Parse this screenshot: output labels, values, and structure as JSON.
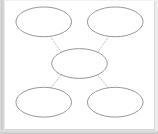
{
  "document": {
    "title": "Concept Map",
    "background_color": "#ffffff",
    "page_border_color": "#d6d6d6",
    "gutter_color": "#c9c9c9"
  },
  "diagram": {
    "type": "concept-map",
    "layout": "hub-and-spoke",
    "node_count": 5,
    "connector_count": 4,
    "node_shape": "ellipse",
    "node_fill": "#ffffff",
    "node_stroke": "#8a8a8a",
    "connector_stroke": "#b9b9b9",
    "connector_style": "dotted",
    "nodes": [
      {
        "id": "node-top-left",
        "label": "",
        "cx": 39,
        "cy": 21,
        "rx": 28,
        "ry": 15
      },
      {
        "id": "node-top-right",
        "label": "",
        "cx": 111,
        "cy": 21,
        "rx": 28,
        "ry": 15
      },
      {
        "id": "node-center",
        "label": "",
        "cx": 75,
        "cy": 63,
        "rx": 28,
        "ry": 15
      },
      {
        "id": "node-bottom-left",
        "label": "",
        "cx": 39,
        "cy": 102,
        "rx": 28,
        "ry": 15
      },
      {
        "id": "node-bottom-right",
        "label": "",
        "cx": 111,
        "cy": 102,
        "rx": 28,
        "ry": 15
      }
    ],
    "connectors": [
      {
        "id": "connector-center-to-top-left",
        "from": "node-center",
        "to": "node-top-left",
        "x1": 57,
        "y1": 52,
        "x2": 45,
        "y2": 35
      },
      {
        "id": "connector-center-to-top-right",
        "from": "node-center",
        "to": "node-top-right",
        "x1": 93,
        "y1": 52,
        "x2": 105,
        "y2": 35
      },
      {
        "id": "connector-center-to-bottom-left",
        "from": "node-center",
        "to": "node-bottom-left",
        "x1": 57,
        "y1": 74,
        "x2": 45,
        "y2": 89
      },
      {
        "id": "connector-center-to-bottom-right",
        "from": "node-center",
        "to": "node-bottom-right",
        "x1": 93,
        "y1": 74,
        "x2": 105,
        "y2": 89
      }
    ]
  }
}
